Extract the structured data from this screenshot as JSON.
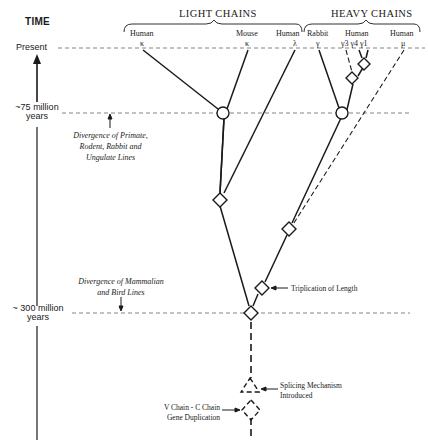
{
  "axis": {
    "title": "TIME",
    "present_label": "Present",
    "marks": [
      {
        "label_line1": "~75 million",
        "label_line2": "years"
      },
      {
        "label_line1": "~ 300 million",
        "label_line2": "years"
      }
    ]
  },
  "groups": {
    "light": {
      "title": "LIGHT CHAINS"
    },
    "heavy": {
      "title": "HEAVY CHAINS"
    }
  },
  "leaves": [
    {
      "species": "Human",
      "chain": "κ"
    },
    {
      "species": "Mouse",
      "chain": "κ"
    },
    {
      "species": "Human",
      "chain": "λ"
    },
    {
      "species": "Rabbit",
      "chain": "γ"
    },
    {
      "species": "Human",
      "chain": "γ3 γ4 γ1"
    },
    {
      "species": "Human",
      "chain": "μ"
    }
  ],
  "annotations": {
    "divergence_primate": {
      "line1": "Divergence of Primate,",
      "line2": "Rodent, Rabbit and",
      "line3": "Ungulate Lines"
    },
    "divergence_bird": {
      "line1": "Divergence of Mammalian",
      "line2": "and Bird Lines"
    },
    "triplication": "Triplication of Length",
    "splicing": {
      "line1": "Splicing Mechanism",
      "line2": "Introduced"
    },
    "vc_duplication": {
      "line1": "V Chain - C Chain",
      "line2": "Gene Duplication"
    }
  },
  "colors": {
    "ink": "#1a1a1a",
    "dash": "#555555",
    "background": "#ffffff"
  }
}
